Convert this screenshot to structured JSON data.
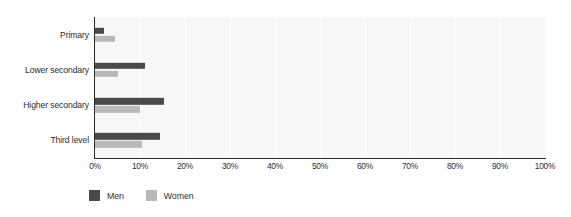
{
  "chart_data": {
    "type": "bar",
    "orientation": "horizontal",
    "title": "",
    "subtitle": "",
    "xlabel": "",
    "ylabel": "",
    "categories": [
      "Primary",
      "Lower secondary",
      "Higher secondary",
      "Third level"
    ],
    "series": [
      {
        "name": "Men",
        "color": "#4a4a4a",
        "values": [
          2.0,
          11.0,
          15.3,
          14.5
        ]
      },
      {
        "name": "Women",
        "color": "#b9b9b9",
        "values": [
          4.5,
          5.0,
          10.0,
          10.5
        ]
      }
    ],
    "xlim": [
      0,
      100
    ],
    "xticks": [
      0,
      10,
      20,
      30,
      40,
      50,
      60,
      70,
      80,
      90,
      100
    ],
    "xtick_labels": [
      "0%",
      "10%",
      "20%",
      "30%",
      "40%",
      "50%",
      "60%",
      "70%",
      "80%",
      "90%",
      "100%"
    ],
    "unit": "%",
    "grid": "vertical",
    "legend_position": "bottom-left",
    "plot_background": "#f7f7f7",
    "axis_color": "#2b2b2b",
    "gridline_color": "#ffffff"
  }
}
